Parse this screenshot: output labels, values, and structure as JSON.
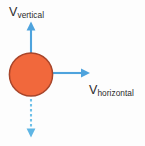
{
  "diagram": {
    "background_color": "#fdfdfd",
    "labels": {
      "vertical": {
        "base": "V",
        "subscript": "vertical"
      },
      "horizontal": {
        "base": "V",
        "subscript": "horizontal"
      }
    },
    "colors": {
      "ball_fill": "#f1683c",
      "ball_stroke": "#a8452a",
      "arrow": "#4ea3dd",
      "text": "#2b2b2b"
    },
    "ball": {
      "name": "projectile",
      "center_x": 31,
      "center_y": 74,
      "radius": 22
    },
    "vectors": [
      {
        "name": "vertical-velocity-vector",
        "label": "V_vertical",
        "style": "solid",
        "direction": "up",
        "from_x": 31,
        "from_y": 52,
        "to_x": 31,
        "to_y": 23
      },
      {
        "name": "horizontal-velocity-vector",
        "label": "V_horizontal",
        "style": "solid",
        "direction": "right",
        "from_x": 52,
        "from_y": 73,
        "to_x": 90,
        "to_y": 73
      },
      {
        "name": "downward-dashed-vector",
        "label": "",
        "style": "dashed",
        "direction": "down",
        "from_x": 31,
        "from_y": 97,
        "to_x": 31,
        "to_y": 137
      }
    ]
  }
}
